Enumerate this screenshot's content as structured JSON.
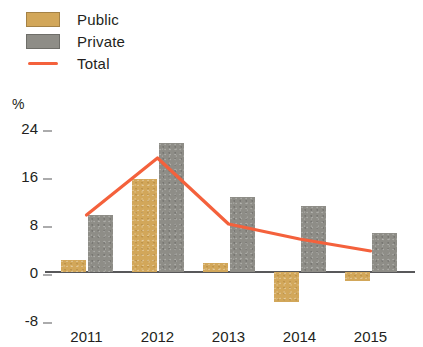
{
  "legend": {
    "items": [
      {
        "label": "Public",
        "type": "swatch",
        "color": "#d2a75a",
        "name": "legend-item-public"
      },
      {
        "label": "Private",
        "type": "swatch",
        "color": "#8e8d87",
        "name": "legend-item-private"
      },
      {
        "label": "Total",
        "type": "line",
        "color": "#f4613c",
        "name": "legend-item-total"
      }
    ]
  },
  "axis": {
    "unit": "%",
    "yticks": [
      "24",
      "16",
      "8",
      "0",
      "-8"
    ],
    "ytick_values": [
      24,
      16,
      8,
      0,
      -8
    ],
    "ylim": [
      -8,
      24
    ],
    "xticks": [
      "2011",
      "2012",
      "2013",
      "2014",
      "2015"
    ]
  },
  "colors": {
    "public": "#d2a75a",
    "private": "#8e8d87",
    "total": "#f4613c",
    "axis": "#58585a",
    "text": "#231f20",
    "background": "#ffffff"
  },
  "chart_data": {
    "type": "bar",
    "title": "",
    "subtitle": "",
    "xlabel": "",
    "ylabel": "%",
    "ylim": [
      -8,
      24
    ],
    "grid": false,
    "legend_position": "top-left",
    "categories": [
      "2011",
      "2012",
      "2013",
      "2014",
      "2015"
    ],
    "series": [
      {
        "name": "Public",
        "type": "bar",
        "color": "#d2a75a",
        "values": [
          2.0,
          15.5,
          1.5,
          -5.0,
          -1.5
        ]
      },
      {
        "name": "Private",
        "type": "bar",
        "color": "#8e8d87",
        "values": [
          9.5,
          21.5,
          12.5,
          11.0,
          6.5
        ]
      },
      {
        "name": "Total",
        "type": "line",
        "color": "#f4613c",
        "values": [
          9.5,
          19.0,
          8.0,
          5.5,
          3.5
        ]
      }
    ]
  }
}
